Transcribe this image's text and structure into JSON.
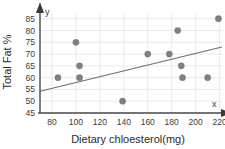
{
  "chart_data": {
    "type": "scatter",
    "title": "",
    "xlabel": "Dietary chloesterol(mg)",
    "ylabel": "Total Fat %",
    "xlim": [
      70,
      222
    ],
    "ylim": [
      45,
      87
    ],
    "grid": true,
    "legend": null,
    "x_ticks": [
      80,
      100,
      120,
      140,
      160,
      180,
      200,
      220
    ],
    "y_ticks": [
      45,
      50,
      55,
      60,
      65,
      70,
      75,
      80,
      85
    ],
    "x_tick_labels": [
      "80",
      "100",
      "120",
      "140",
      "160",
      "180",
      "200",
      "220"
    ],
    "y_tick_labels": [
      "45",
      "50",
      "55",
      "60",
      "65",
      "70",
      "75",
      "80",
      "85"
    ],
    "axis_letters": {
      "x": "x",
      "y": "y"
    },
    "marker_color": "#808080",
    "trendline_color": "#6e6e6e",
    "grid_color": "#dcdcdc",
    "axis_color": "#4a4a4a",
    "points": [
      {
        "x": 85,
        "y": 60
      },
      {
        "x": 100,
        "y": 75
      },
      {
        "x": 103,
        "y": 65
      },
      {
        "x": 103,
        "y": 60
      },
      {
        "x": 139,
        "y": 50
      },
      {
        "x": 160,
        "y": 70
      },
      {
        "x": 178,
        "y": 70
      },
      {
        "x": 185,
        "y": 80
      },
      {
        "x": 188,
        "y": 65
      },
      {
        "x": 189,
        "y": 60
      },
      {
        "x": 210,
        "y": 60
      },
      {
        "x": 219,
        "y": 85
      }
    ],
    "trendline": {
      "x_start": 70,
      "y_start": 54.2,
      "x_end": 222,
      "y_end": 73.0
    }
  }
}
